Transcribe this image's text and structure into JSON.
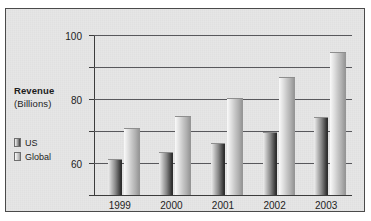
{
  "chart_data": {
    "type": "bar",
    "title": "",
    "xlabel": "",
    "ylabel": "Revenue (Billions)",
    "ylabel_line1": "Revenue",
    "ylabel_line2": "(Billions)",
    "categories": [
      "1999",
      "2000",
      "2001",
      "2002",
      "2003"
    ],
    "series": [
      {
        "name": "US",
        "values": [
          22,
          26,
          32,
          39,
          48
        ],
        "color": "#3a3a3a"
      },
      {
        "name": "Global",
        "values": [
          41,
          49,
          60,
          73,
          89
        ],
        "color": "#b0b0b0"
      }
    ],
    "ylim": [
      0,
      100
    ],
    "yticks": [
      "0",
      "20",
      "40",
      "60",
      "80",
      "100"
    ],
    "ytick_values": [
      0,
      20,
      40,
      60,
      80,
      100
    ],
    "grid": true,
    "legend_position": "left",
    "orientation": "vertical"
  },
  "legend": {
    "items": [
      {
        "label": "US",
        "swatch": "us-swatch-icon"
      },
      {
        "label": "Global",
        "swatch": "global-swatch-icon"
      }
    ]
  },
  "colors": {
    "figure_background": "#e6e6e6",
    "figure_border": "#4a4a4a",
    "gridline": "#58585c",
    "axis": "#3c3c3c",
    "text": "#1d1d1d",
    "page_background": "#ffffff"
  }
}
